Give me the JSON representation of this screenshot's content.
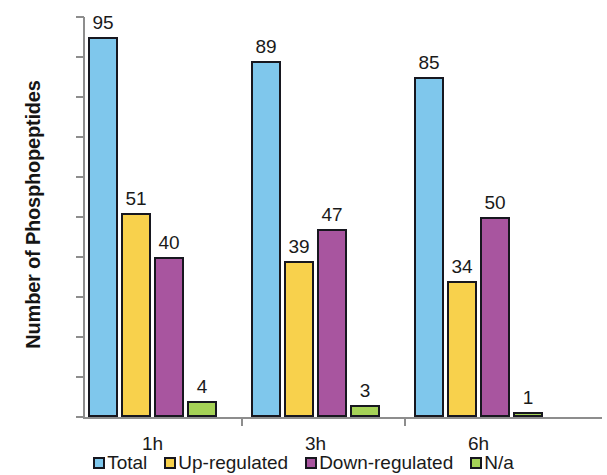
{
  "chart_data": {
    "type": "bar",
    "title": "",
    "xlabel": "",
    "ylabel": "Number of Phosphopeptides",
    "categories": [
      "1h",
      "3h",
      "6h"
    ],
    "series": [
      {
        "name": "Total",
        "color": "#7fc7ec",
        "values": [
          95,
          89,
          85
        ]
      },
      {
        "name": "Up-regulated",
        "color": "#f8d14c",
        "values": [
          51,
          39,
          34
        ]
      },
      {
        "name": "Down-regulated",
        "color": "#a8559f",
        "values": [
          40,
          47,
          50
        ]
      },
      {
        "name": "N/a",
        "color": "#a5d257",
        "values": [
          4,
          3,
          1
        ]
      }
    ],
    "ylim": [
      0,
      100
    ],
    "yticks": [
      0,
      10,
      20,
      30,
      40,
      50,
      60,
      70,
      80,
      90,
      100
    ],
    "ytick_labels": [
      "0",
      "10",
      "20",
      "30",
      "40",
      "50",
      "60",
      "70",
      "80",
      "90",
      "100"
    ],
    "grid": false,
    "legend_position": "bottom",
    "data_labels": true,
    "bar_border_color": "#17171f",
    "axis_color": "#8d8d8d"
  },
  "legend": {
    "items": [
      {
        "label": "Total",
        "color": "#7fc7ec"
      },
      {
        "label": "Up-regulated",
        "color": "#f8d14c"
      },
      {
        "label": "Down-regulated",
        "color": "#a8559f"
      },
      {
        "label": "N/a",
        "color": "#a5d257"
      }
    ]
  }
}
